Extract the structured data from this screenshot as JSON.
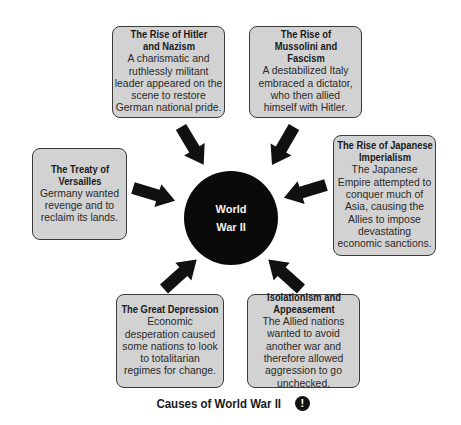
{
  "diagram": {
    "center": {
      "line1": "World",
      "line2": "War II"
    },
    "causes": [
      {
        "id": "hitler",
        "title": "The Rise of Hitler and Nazism",
        "description": "A charismatic and ruthlessly militant leader appeared on the scene to restore German national pride."
      },
      {
        "id": "mussolini",
        "title": "The Rise of Mussolini and Fascism",
        "description": "A destabilized Italy embraced a dictator, who then allied himself with Hitler."
      },
      {
        "id": "japanese",
        "title": "The Rise of Japanese Imperialism",
        "description": "The Japanese Empire attempted to conquer much of Asia, causing the Allies to impose devastating economic sanctions."
      },
      {
        "id": "versailles",
        "title": "The Treaty of Versailles",
        "description": "Germany wanted revenge and to reclaim its lands."
      },
      {
        "id": "depression",
        "title": "The Great Depression",
        "description": "Economic desperation caused some nations to look to totalitarian regimes for change."
      },
      {
        "id": "isolationism",
        "title": "Isolationism and Appeasement",
        "description": "The Allied nations wanted to avoid another war and therefore allowed aggression to go unchecked."
      }
    ],
    "caption": "Causes of World War II",
    "caption_icon": "alert-icon",
    "caption_icon_glyph": "!",
    "colors": {
      "box_fill": "#d2d2d2",
      "box_border": "#3a3a3a",
      "circle_fill": "#0a0a0a",
      "arrow_fill": "#111111"
    }
  }
}
